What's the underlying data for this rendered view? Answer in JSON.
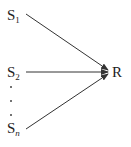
{
  "diagram": {
    "sources": [
      {
        "base": "S",
        "sub": "1"
      },
      {
        "base": "S",
        "sub": "2"
      },
      {
        "base": "S",
        "sub": "n"
      }
    ],
    "target": "R",
    "ellipsis": "vertical dots",
    "edges": [
      {
        "from": "S1",
        "to": "R"
      },
      {
        "from": "S2",
        "to": "R"
      },
      {
        "from": "Sn",
        "to": "R"
      }
    ]
  }
}
